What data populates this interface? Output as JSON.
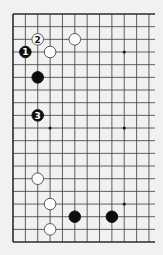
{
  "diagram": {
    "type": "go-board-partial",
    "background_color": "#f1f1f1",
    "line_color": "#3a3a3a",
    "edge_color": "#2a2a2a",
    "visible_columns": 12,
    "visible_rows": 19,
    "edges": {
      "left": true,
      "top": true,
      "bottom": true,
      "right": false
    },
    "grid": {
      "origin_x": 13,
      "origin_y": 14,
      "spacing_x": 12.36,
      "spacing_y": 12.67,
      "right_extent": 155
    },
    "star_points": [
      {
        "col": 9,
        "row": 3
      },
      {
        "col": 3,
        "row": 9
      },
      {
        "col": 9,
        "row": 9
      },
      {
        "col": 9,
        "row": 15
      }
    ],
    "stones": [
      {
        "color": "black",
        "col": 1,
        "row": 3,
        "label": "1"
      },
      {
        "color": "white",
        "col": 2,
        "row": 2,
        "label": "2"
      },
      {
        "color": "black",
        "col": 2,
        "row": 8,
        "label": "3"
      },
      {
        "color": "white",
        "col": 5,
        "row": 2,
        "label": ""
      },
      {
        "color": "white",
        "col": 3,
        "row": 3,
        "label": ""
      },
      {
        "color": "black",
        "col": 2,
        "row": 5,
        "label": ""
      },
      {
        "color": "white",
        "col": 2,
        "row": 13,
        "label": ""
      },
      {
        "color": "white",
        "col": 3,
        "row": 15,
        "label": ""
      },
      {
        "color": "white",
        "col": 3,
        "row": 17,
        "label": ""
      },
      {
        "color": "black",
        "col": 5,
        "row": 16,
        "label": ""
      },
      {
        "color": "black",
        "col": 8,
        "row": 16,
        "label": ""
      }
    ]
  }
}
